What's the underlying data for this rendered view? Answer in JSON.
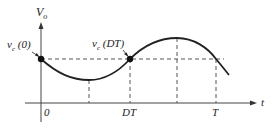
{
  "diagram": {
    "y_axis_label": "V",
    "y_axis_sub": "o",
    "x_axis_label": "t",
    "point_labels": {
      "start": "v",
      "start_sub": "c",
      "start_arg": " (0)",
      "mid": "v",
      "mid_sub": "c",
      "mid_arg": " (DT)"
    },
    "tick_labels": [
      "0",
      "DT",
      "T"
    ],
    "colors": {
      "curve": "#222222",
      "dashed": "#555555",
      "axis": "#444444"
    }
  }
}
